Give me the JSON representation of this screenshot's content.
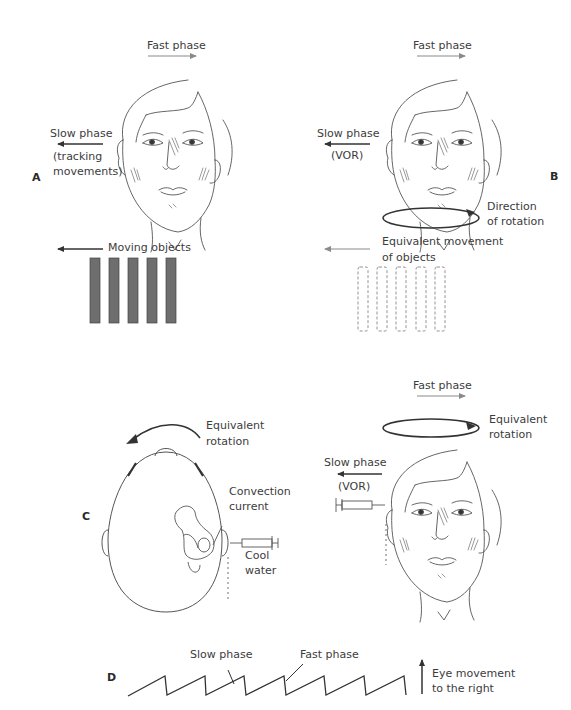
{
  "figure": {
    "panels": {
      "A": {
        "letter": "A",
        "fast_phase": "Fast phase",
        "slow_phase": "Slow phase",
        "slow_phase_detail_1": "(tracking",
        "slow_phase_detail_2": "movements)",
        "moving_objects": "Moving objects",
        "object_count": 5
      },
      "B": {
        "letter": "B",
        "fast_phase": "Fast phase",
        "slow_phase": "Slow phase",
        "slow_phase_detail": "(VOR)",
        "direction_1": "Direction",
        "direction_2": "of rotation",
        "equivalent_1": "Equivalent movement",
        "equivalent_2": "of objects",
        "object_count": 5
      },
      "C": {
        "letter": "C",
        "equivalent_rotation_1": "Equivalent",
        "equivalent_rotation_2": "rotation",
        "convection_1": "Convection",
        "convection_2": "current",
        "cool_1": "Cool",
        "cool_2": "water",
        "right_fast_phase": "Fast phase",
        "right_equivalent_1": "Equivalent",
        "right_equivalent_2": "rotation",
        "right_slow_phase": "Slow phase",
        "right_slow_detail": "(VOR)"
      },
      "D": {
        "letter": "D",
        "slow_phase": "Slow phase",
        "fast_phase": "Fast phase",
        "eye_movement_1": "Eye movement",
        "eye_movement_2": "to the right"
      }
    },
    "colors": {
      "line": "#3a3a3a",
      "gray_arrow": "#8a8a8a",
      "bar_fill": "#6e6e6e",
      "dashed": "#8a8a8a"
    }
  }
}
